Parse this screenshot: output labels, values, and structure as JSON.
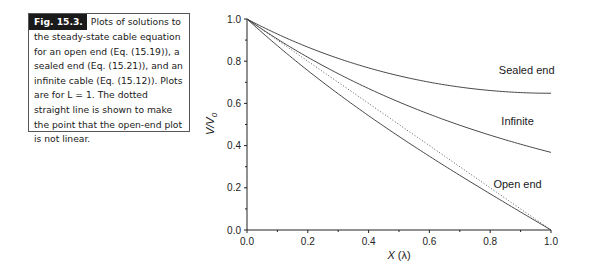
{
  "caption": {
    "label": "Fig. 15.3.",
    "text": "Plots of solutions to the steady-state cable equation for an open end (Eq. (15.19)), a sealed end (Eq. (15.21)), and an infinite cable (Eq. (15.12)). Plots are for L = 1. The dotted straight line is shown to make the point that the open-end plot is not linear."
  },
  "chart_data": {
    "type": "line",
    "title": "",
    "xlabel": "X (λ)",
    "ylabel": "V/V0",
    "xlim": [
      0.0,
      1.0
    ],
    "ylim": [
      0.0,
      1.0
    ],
    "x_ticks": [
      "0.0",
      "0.2",
      "0.4",
      "0.6",
      "0.8",
      "1.0"
    ],
    "y_ticks": [
      "0.0",
      "0.2",
      "0.4",
      "0.6",
      "0.8",
      "1.0"
    ],
    "grid": false,
    "legend": "inline labels",
    "x": [
      0.0,
      0.1,
      0.2,
      0.3,
      0.4,
      0.5,
      0.6,
      0.7,
      0.8,
      0.9,
      1.0
    ],
    "series": [
      {
        "name": "Sealed end",
        "style": "solid",
        "values": [
          1.0,
          0.9223,
          0.8544,
          0.7955,
          0.7452,
          0.7031,
          0.6686,
          0.6416,
          0.6219,
          0.6092,
          0.6481
        ]
      },
      {
        "name": "Infinite",
        "style": "solid",
        "values": [
          1.0,
          0.9048,
          0.8187,
          0.7408,
          0.6703,
          0.6065,
          0.5488,
          0.4966,
          0.4493,
          0.4066,
          0.3679
        ]
      },
      {
        "name": "Open end",
        "style": "solid",
        "values": [
          1.0,
          0.8482,
          0.7057,
          0.5728,
          0.4486,
          0.3329,
          0.2247,
          0.1235,
          0.0287,
          -0.0001,
          0.0
        ]
      },
      {
        "name": "Straight reference",
        "style": "dotted",
        "values": [
          1.0,
          0.9,
          0.8,
          0.7,
          0.6,
          0.5,
          0.4,
          0.3,
          0.2,
          0.1,
          0.0
        ]
      }
    ],
    "annotations": [
      {
        "text": "Sealed end",
        "x": 0.92,
        "y": 0.74
      },
      {
        "text": "Infinite",
        "x": 0.89,
        "y": 0.5
      },
      {
        "text": "Open end",
        "x": 0.89,
        "y": 0.2
      }
    ]
  },
  "axes": {
    "xlabel_main": "X",
    "xlabel_unit": "(λ)",
    "ylabel_main": "V/V",
    "ylabel_sub": "0"
  }
}
